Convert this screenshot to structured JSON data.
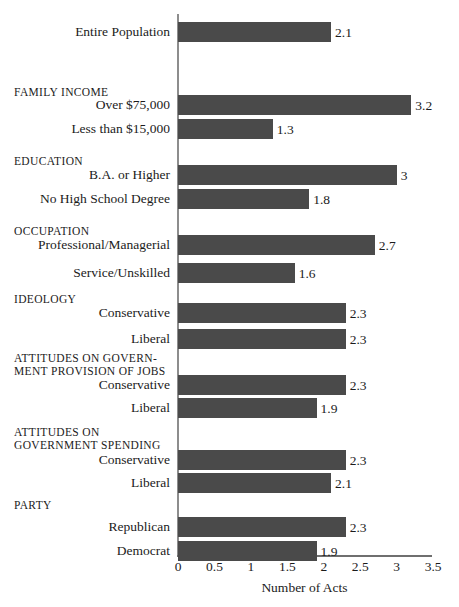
{
  "chart_data": {
    "type": "bar",
    "orientation": "horizontal",
    "title": "",
    "xlabel": "Number of Acts",
    "ylabel": "",
    "xlim": [
      0,
      3.5
    ],
    "xticks": [
      "0",
      "0.5",
      "1",
      "1.5",
      "2",
      "2.5",
      "3",
      "3.5"
    ],
    "xtick_values": [
      0,
      0.5,
      1,
      1.5,
      2,
      2.5,
      3,
      3.5
    ],
    "grid": false,
    "legend": "none",
    "bar_color": "#4a4a4a",
    "axis_color": "#6f6f6f",
    "categories": [
      "Entire Population",
      "Over $75,000",
      "Less than $15,000",
      "B.A. or Higher",
      "No High School Degree",
      "Professional/Managerial",
      "Service/Unskilled",
      "Conservative",
      "Liberal",
      "Conservative",
      "Liberal",
      "Conservative",
      "Liberal",
      "Republican",
      "Democrat"
    ],
    "values": [
      2.1,
      3.2,
      1.3,
      3,
      1.8,
      2.7,
      1.6,
      2.3,
      2.3,
      2.3,
      1.9,
      2.3,
      2.1,
      2.3,
      1.9
    ],
    "value_labels": [
      "2.1",
      "3.2",
      "1.3",
      "3",
      "1.8",
      "2.7",
      "1.6",
      "2.3",
      "2.3",
      "2.3",
      "1.9",
      "2.3",
      "2.1",
      "2.3",
      "1.9"
    ],
    "group_headers": [
      "FAMILY INCOME",
      "EDUCATION",
      "OCCUPATION",
      "IDEOLOGY",
      "ATTITUDES ON GOVERN-",
      "MENT PROVISION OF JOBS",
      "ATTITUDES ON",
      "GOVERNMENT SPENDING",
      "PARTY"
    ]
  },
  "rows": [
    {
      "label": "Entire Population",
      "value": 2.1,
      "value_label": "2.1",
      "top": 22
    },
    {
      "label": "Over $75,000",
      "value": 3.2,
      "value_label": "3.2",
      "top": 95
    },
    {
      "label": "Less than $15,000",
      "value": 1.3,
      "value_label": "1.3",
      "top": 119
    },
    {
      "label": "B.A. or Higher",
      "value": 3,
      "value_label": "3",
      "top": 165
    },
    {
      "label": "No High School Degree",
      "value": 1.8,
      "value_label": "1.8",
      "top": 189
    },
    {
      "label": "Professional/Managerial",
      "value": 2.7,
      "value_label": "2.7",
      "top": 235
    },
    {
      "label": "Service/Unskilled",
      "value": 1.6,
      "value_label": "1.6",
      "top": 263
    },
    {
      "label": "Conservative",
      "value": 2.3,
      "value_label": "2.3",
      "top": 303
    },
    {
      "label": "Liberal",
      "value": 2.3,
      "value_label": "2.3",
      "top": 329
    },
    {
      "label": "Conservative",
      "value": 2.3,
      "value_label": "2.3",
      "top": 375
    },
    {
      "label": "Liberal",
      "value": 1.9,
      "value_label": "1.9",
      "top": 398
    },
    {
      "label": "Conservative",
      "value": 2.3,
      "value_label": "2.3",
      "top": 450
    },
    {
      "label": "Liberal",
      "value": 2.1,
      "value_label": "2.1",
      "top": 473
    },
    {
      "label": "Republican",
      "value": 2.3,
      "value_label": "2.3",
      "top": 517
    },
    {
      "label": "Democrat",
      "value": 1.9,
      "value_label": "1.9",
      "top": 541
    }
  ],
  "headers": [
    {
      "text": "FAMILY INCOME",
      "top": 86
    },
    {
      "text": "EDUCATION",
      "top": 155
    },
    {
      "text": "OCCUPATION",
      "top": 225
    },
    {
      "text": "IDEOLOGY",
      "top": 293
    },
    {
      "text": "ATTITUDES ON GOVERN-",
      "top": 352
    },
    {
      "text": "MENT PROVISION OF JOBS",
      "top": 365
    },
    {
      "text": "ATTITUDES ON",
      "top": 426
    },
    {
      "text": "GOVERNMENT SPENDING",
      "top": 439
    },
    {
      "text": "PARTY",
      "top": 499
    }
  ],
  "axis": {
    "title": "Number of Acts",
    "ticks": [
      {
        "label": "0",
        "value": 0
      },
      {
        "label": "0.5",
        "value": 0.5
      },
      {
        "label": "1",
        "value": 1
      },
      {
        "label": "1.5",
        "value": 1.5
      },
      {
        "label": "2",
        "value": 2
      },
      {
        "label": "2.5",
        "value": 2.5
      },
      {
        "label": "3",
        "value": 3
      },
      {
        "label": "3.5",
        "value": 3.5
      }
    ]
  }
}
